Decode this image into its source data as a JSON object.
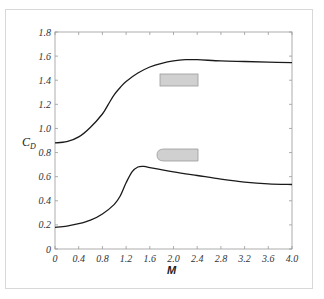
{
  "chart_data": {
    "type": "line",
    "title": "",
    "xlabel": "M",
    "ylabel": "C_D",
    "xlim": [
      0,
      4.0
    ],
    "ylim": [
      0,
      1.8
    ],
    "xticks": [
      "0",
      "0.4",
      "0.8",
      "1.2",
      "1.6",
      "2.0",
      "2.4",
      "2.8",
      "3.2",
      "3.6",
      "4.0"
    ],
    "yticks": [
      "0",
      "0.2",
      "0.4",
      "0.6",
      "0.8",
      "1.0",
      "1.2",
      "1.4",
      "1.6",
      "1.8"
    ],
    "grid": false,
    "legend": "none (shapes drawn next to curves)",
    "series": [
      {
        "name": "Blunt body (flat-faced cylinder)",
        "shape_icon": "rectangle",
        "x": [
          0,
          0.2,
          0.4,
          0.6,
          0.8,
          0.9,
          1.0,
          1.1,
          1.2,
          1.4,
          1.6,
          1.8,
          2.0,
          2.2,
          2.4,
          2.8,
          3.2,
          3.6,
          4.0
        ],
        "values": [
          0.88,
          0.89,
          0.93,
          1.01,
          1.12,
          1.2,
          1.28,
          1.34,
          1.39,
          1.46,
          1.51,
          1.54,
          1.56,
          1.57,
          1.57,
          1.56,
          1.555,
          1.55,
          1.545
        ]
      },
      {
        "name": "Rounded-nose body (ogive)",
        "shape_icon": "bullet",
        "x": [
          0,
          0.2,
          0.4,
          0.6,
          0.8,
          1.0,
          1.1,
          1.2,
          1.3,
          1.4,
          1.5,
          1.6,
          2.0,
          2.4,
          2.8,
          3.2,
          3.6,
          4.0
        ],
        "values": [
          0.18,
          0.19,
          0.21,
          0.24,
          0.29,
          0.37,
          0.44,
          0.55,
          0.64,
          0.68,
          0.685,
          0.675,
          0.64,
          0.61,
          0.58,
          0.555,
          0.54,
          0.535
        ]
      }
    ]
  },
  "labels": {
    "ylabel_main": "C",
    "ylabel_sub": "D",
    "xlabel": "M"
  },
  "colors": {
    "curve": "#1a1a1a",
    "shape_fill": "#d0d0d0",
    "shape_stroke": "#9a9a9a",
    "axis": "#999999"
  }
}
